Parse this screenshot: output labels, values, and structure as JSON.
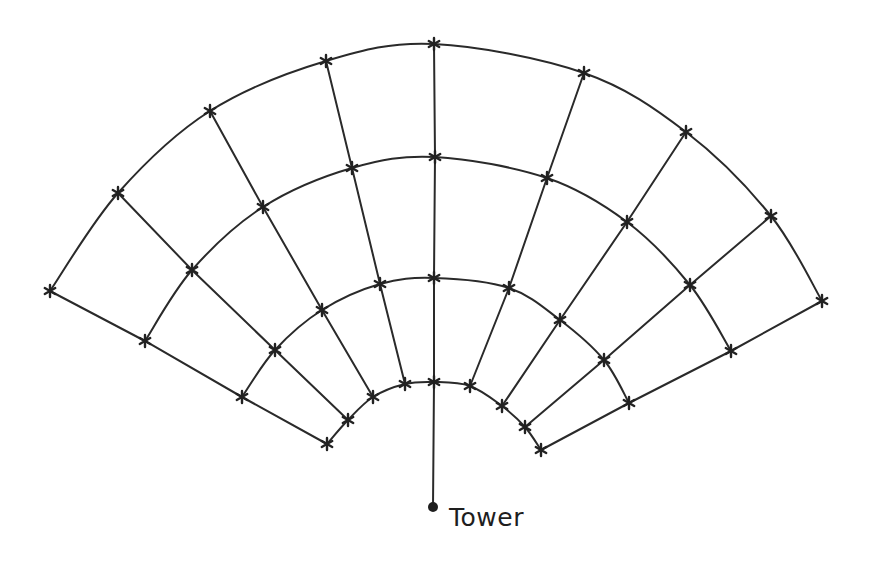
{
  "diagram": {
    "type": "polar-grid-fan",
    "stroke_color": "#2a2a2a",
    "background": "#ffffff",
    "tower": {
      "label": "Tower",
      "point": [
        433,
        507
      ],
      "label_position": [
        449,
        503
      ]
    },
    "marker_icon": "asterisk-cross-marker",
    "rings": [
      {
        "name": "ring-1-inner",
        "points": [
          [
            327,
            444
          ],
          [
            348,
            420
          ],
          [
            373,
            397
          ],
          [
            405,
            384
          ],
          [
            434,
            382
          ],
          [
            470,
            386
          ],
          [
            502,
            406
          ],
          [
            525,
            427
          ],
          [
            541,
            450
          ]
        ]
      },
      {
        "name": "ring-2",
        "points": [
          [
            242,
            397
          ],
          [
            275,
            350
          ],
          [
            322,
            310
          ],
          [
            380,
            284
          ],
          [
            434,
            278
          ],
          [
            509,
            288
          ],
          [
            560,
            320
          ],
          [
            604,
            360
          ],
          [
            629,
            403
          ]
        ]
      },
      {
        "name": "ring-3",
        "points": [
          [
            145,
            341
          ],
          [
            192,
            270
          ],
          [
            263,
            207
          ],
          [
            352,
            168
          ],
          [
            435,
            157
          ],
          [
            547,
            178
          ],
          [
            627,
            222
          ],
          [
            690,
            285
          ],
          [
            731,
            351
          ]
        ]
      },
      {
        "name": "ring-4-outer",
        "points": [
          [
            50,
            291
          ],
          [
            118,
            193
          ],
          [
            210,
            111
          ],
          [
            326,
            61
          ],
          [
            434,
            44
          ],
          [
            584,
            73
          ],
          [
            686,
            132
          ],
          [
            771,
            216
          ],
          [
            822,
            301
          ]
        ]
      }
    ],
    "radial_count": 9,
    "ring_count": 4,
    "center_radial_extends_to_tower": true
  }
}
